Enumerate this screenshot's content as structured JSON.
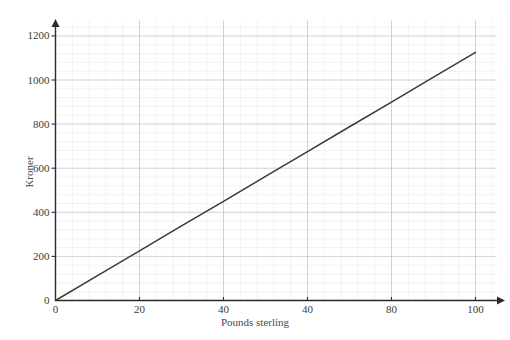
{
  "chart_data": {
    "type": "line",
    "title": "",
    "subtitle": "",
    "xlabel": "Pounds sterling",
    "ylabel": "Kroner",
    "xlim": [
      0,
      105
    ],
    "ylim": [
      0,
      1270
    ],
    "grid": true,
    "legend": false,
    "legend_position": "none",
    "series": [
      {
        "name": "Pounds to Kroner conversion",
        "color": "#3a3a3a",
        "x": [
          0,
          10,
          20,
          30,
          40,
          50,
          60,
          70,
          80,
          90,
          100
        ],
        "values": [
          0,
          113,
          225,
          338,
          450,
          563,
          675,
          788,
          900,
          1013,
          1125
        ]
      }
    ],
    "x_ticks": [
      {
        "value": 0,
        "label": "0"
      },
      {
        "value": 20,
        "label": "20"
      },
      {
        "value": 40,
        "label": "40"
      },
      {
        "value": 60,
        "label": "40"
      },
      {
        "value": 80,
        "label": "80"
      },
      {
        "value": 100,
        "label": "100"
      }
    ],
    "y_ticks": [
      {
        "value": 0,
        "label": "0"
      },
      {
        "value": 200,
        "label": "200"
      },
      {
        "value": 400,
        "label": "400"
      },
      {
        "value": 600,
        "label": "600"
      },
      {
        "value": 800,
        "label": "800"
      },
      {
        "value": 1000,
        "label": "1000"
      },
      {
        "value": 1200,
        "label": "1200"
      }
    ],
    "x_minor_step": 4,
    "y_minor_step": 40,
    "annotations": []
  },
  "colors": {
    "line": "#3a3a3a",
    "axis": "#2b2b2b",
    "grid_major": "#b9bfd0",
    "grid_minor": "#e3e6ee",
    "tick_text": "#3a3a3a",
    "axis_title_text": "#4a4a4a",
    "background": "#ffffff"
  }
}
